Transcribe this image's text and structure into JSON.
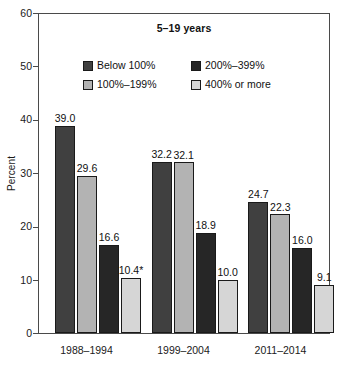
{
  "chart_data": {
    "type": "bar",
    "title": "5–19 years",
    "xlabel": "",
    "ylabel": "Percent",
    "ylim": [
      0,
      60
    ],
    "yticks": [
      0,
      10,
      20,
      30,
      40,
      50,
      60
    ],
    "ytick_labels": [
      "0",
      "10",
      "20",
      "30",
      "40",
      "50",
      "60"
    ],
    "grid": false,
    "legend_position": "top-center",
    "categories": [
      "1988–1994",
      "1999–2004",
      "2011–2014"
    ],
    "series": [
      {
        "name": "Below 100%",
        "color": "#404040",
        "values": [
          39.0,
          32.2,
          24.7
        ],
        "labels": [
          "39.0",
          "32.2",
          "24.7"
        ]
      },
      {
        "name": "100%–199%",
        "color": "#b3b3b3",
        "values": [
          29.6,
          32.1,
          22.3
        ],
        "labels": [
          "29.6",
          "32.1",
          "22.3"
        ]
      },
      {
        "name": "200%–399%",
        "color": "#262626",
        "values": [
          16.6,
          18.9,
          16.0
        ],
        "labels": [
          "16.6",
          "18.9",
          "16.0"
        ]
      },
      {
        "name": "400% or more",
        "color": "#d6d6d6",
        "values": [
          10.4,
          10.0,
          9.1
        ],
        "labels": [
          "10.4*",
          "10.0",
          "9.1"
        ]
      }
    ],
    "footnote_marker": "*"
  }
}
